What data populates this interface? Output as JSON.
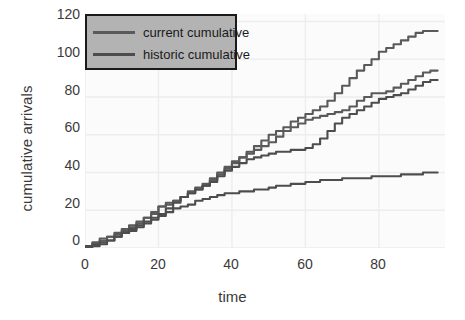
{
  "chart_data": {
    "type": "line",
    "title": "",
    "xlabel": "time",
    "ylabel": "cumulative arrivals",
    "xlim": [
      0,
      98
    ],
    "ylim": [
      0,
      124
    ],
    "xticks": [
      0,
      20,
      40,
      60,
      80
    ],
    "yticks": [
      0,
      20,
      40,
      60,
      80,
      100,
      120
    ],
    "grid": true,
    "legend_position": "upper left",
    "legend_entries": [
      "current cumulative",
      "historic cumulative"
    ],
    "series": [
      {
        "name": "current cumulative",
        "color": "#5a5a5a",
        "x": [
          0,
          2,
          4,
          6,
          8,
          10,
          12,
          14,
          16,
          18,
          20,
          22,
          24,
          26,
          28,
          30,
          32,
          34,
          36,
          38,
          40,
          42,
          44,
          46,
          48,
          50,
          52,
          54,
          56,
          58,
          60,
          62,
          64,
          66,
          68,
          70,
          72,
          74,
          76,
          78,
          80,
          82,
          84,
          86,
          88,
          90,
          92,
          94,
          96
        ],
        "values": [
          1,
          3,
          5,
          6,
          8,
          10,
          12,
          14,
          16,
          19,
          22,
          23,
          25,
          27,
          29,
          31,
          33,
          36,
          39,
          42,
          45,
          48,
          51,
          54,
          57,
          60,
          62,
          64,
          67,
          69,
          71,
          73,
          75,
          78,
          82,
          86,
          90,
          94,
          97,
          100,
          104,
          106,
          108,
          110,
          112,
          114,
          115,
          115,
          115
        ]
      },
      {
        "name": "current cumulative (2)",
        "color": "#5a5a5a",
        "x": [
          0,
          2,
          4,
          6,
          8,
          10,
          12,
          14,
          16,
          18,
          20,
          22,
          24,
          26,
          28,
          30,
          32,
          34,
          36,
          38,
          40,
          42,
          44,
          46,
          48,
          50,
          52,
          54,
          56,
          58,
          60,
          62,
          64,
          66,
          68,
          70,
          72,
          74,
          76,
          78,
          80,
          82,
          84,
          86,
          88,
          90,
          92,
          94,
          96
        ],
        "values": [
          1,
          2,
          4,
          6,
          7,
          9,
          11,
          13,
          16,
          18,
          22,
          24,
          25,
          27,
          30,
          32,
          34,
          37,
          40,
          43,
          46,
          48,
          50,
          52,
          54,
          56,
          59,
          62,
          64,
          66,
          68,
          69,
          70,
          71,
          72,
          73,
          75,
          78,
          80,
          82,
          82,
          83,
          85,
          87,
          89,
          91,
          93,
          94,
          94
        ]
      },
      {
        "name": "historic cumulative",
        "color": "#4d4d4d",
        "x": [
          0,
          2,
          4,
          6,
          8,
          10,
          12,
          14,
          16,
          18,
          20,
          22,
          24,
          26,
          28,
          30,
          32,
          34,
          36,
          38,
          40,
          42,
          44,
          46,
          48,
          50,
          52,
          54,
          56,
          58,
          60,
          62,
          64,
          66,
          68,
          70,
          72,
          74,
          76,
          78,
          80,
          82,
          84,
          86,
          88,
          90,
          92,
          94,
          96
        ],
        "values": [
          0,
          1,
          2,
          4,
          6,
          8,
          10,
          12,
          14,
          16,
          18,
          21,
          24,
          27,
          29,
          31,
          33,
          35,
          38,
          41,
          43,
          45,
          47,
          48,
          49,
          50,
          51,
          51,
          52,
          52,
          53,
          55,
          58,
          62,
          66,
          69,
          71,
          73,
          75,
          77,
          79,
          80,
          81,
          82,
          84,
          86,
          88,
          89,
          89
        ]
      },
      {
        "name": "historic cumulative (2)",
        "color": "#4d4d4d",
        "x": [
          0,
          2,
          4,
          6,
          8,
          10,
          12,
          14,
          16,
          18,
          20,
          22,
          24,
          26,
          28,
          30,
          32,
          34,
          36,
          38,
          40,
          42,
          44,
          46,
          48,
          50,
          52,
          54,
          56,
          58,
          60,
          62,
          64,
          66,
          68,
          70,
          72,
          74,
          76,
          78,
          80,
          82,
          84,
          86,
          88,
          90,
          92,
          94,
          96
        ],
        "values": [
          1,
          2,
          3,
          4,
          6,
          8,
          9,
          11,
          13,
          15,
          17,
          19,
          21,
          22,
          23,
          25,
          26,
          27,
          28,
          29,
          29,
          30,
          30,
          31,
          31,
          32,
          33,
          33,
          34,
          34,
          35,
          35,
          36,
          36,
          36,
          37,
          37,
          37,
          37,
          38,
          38,
          38,
          38,
          39,
          39,
          39,
          40,
          40,
          40
        ]
      }
    ]
  },
  "axes": {
    "ylabel": "cumulative arrivals",
    "xlabel": "time",
    "yticks": [
      "0",
      "20",
      "40",
      "60",
      "80",
      "100",
      "120"
    ],
    "xticks": [
      "0",
      "20",
      "40",
      "60",
      "80"
    ]
  },
  "legend": {
    "items": [
      {
        "label": "current cumulative"
      },
      {
        "label": "historic cumulative"
      }
    ]
  },
  "colors": {
    "line_current": "#5a5a5a",
    "line_historic": "#4d4d4d",
    "legend_background": "#b3b3b3",
    "legend_border": "#1a1a1a",
    "plot_background": "#fbfbfb",
    "grid": "#ededed",
    "text": "#3a3a3a"
  }
}
